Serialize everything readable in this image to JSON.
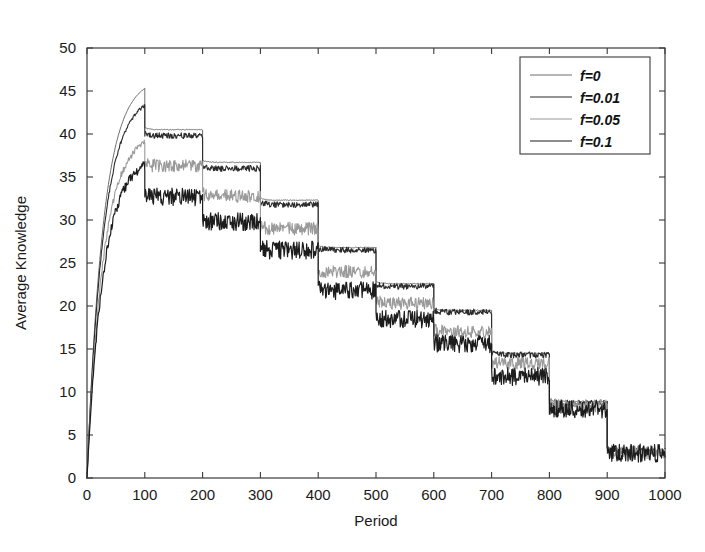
{
  "figure": {
    "width": 705,
    "height": 552,
    "background": "#ffffff",
    "frame_color": "#3a3a3a"
  },
  "chart_data": {
    "type": "line",
    "title": "",
    "xlabel": "Period",
    "ylabel": "Average Knowledge",
    "xlim": [
      0,
      1000
    ],
    "ylim": [
      0,
      50
    ],
    "xticks": [
      0,
      100,
      200,
      300,
      400,
      500,
      600,
      700,
      800,
      900,
      1000
    ],
    "yticks": [
      0,
      5,
      10,
      15,
      20,
      25,
      30,
      35,
      40,
      45,
      50
    ],
    "xtick_labels": [
      "0",
      "100",
      "200",
      "300",
      "400",
      "500",
      "600",
      "700",
      "800",
      "900",
      "1000"
    ],
    "ytick_labels": [
      "0",
      "5",
      "10",
      "15",
      "20",
      "25",
      "30",
      "35",
      "40",
      "45",
      "50"
    ],
    "grid": false,
    "legend_position": "upper right",
    "legend_entries": [
      "f=0",
      "f=0.01",
      "f=0.05",
      "f=0.1"
    ],
    "series": [
      {
        "name": "f=0",
        "color": "#6e6e6e",
        "width": 1.0,
        "noise": 0.05,
        "peak": 45.3,
        "plateaus": [
          40.5,
          36.7,
          32.3,
          26.8,
          22.6,
          19.5,
          14.5,
          8.9,
          3.2
        ]
      },
      {
        "name": "f=0.01",
        "color": "#2b2b2b",
        "width": 1.1,
        "noise": 0.35,
        "peak": 43.3,
        "plateaus": [
          39.8,
          36.0,
          31.8,
          26.5,
          22.3,
          19.3,
          14.3,
          8.7,
          3.1
        ]
      },
      {
        "name": "f=0.05",
        "color": "#9a9a9a",
        "width": 1.1,
        "noise": 0.75,
        "peak": 39.0,
        "plateaus": [
          36.3,
          32.8,
          29.0,
          24.0,
          20.3,
          17.0,
          13.3,
          8.4,
          3.0
        ]
      },
      {
        "name": "f=0.1",
        "color": "#1c1c1c",
        "width": 1.2,
        "noise": 1.05,
        "peak": 36.3,
        "plateaus": [
          32.7,
          29.8,
          26.5,
          21.8,
          18.5,
          15.6,
          11.8,
          8.0,
          2.9
        ]
      }
    ],
    "segment_breaks": [
      100,
      200,
      300,
      400,
      500,
      600,
      700,
      800,
      900,
      1000
    ]
  }
}
